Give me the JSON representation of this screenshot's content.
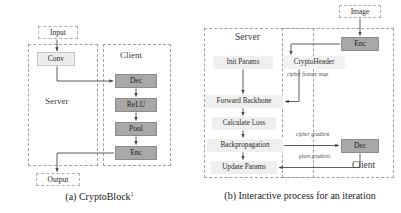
{
  "figure": {
    "subfigures": [
      {
        "id": "a",
        "caption_prefix": "(a)",
        "caption_text": "CryptoBlock",
        "caption_superscript": "1",
        "regions": [
          {
            "name": "server",
            "label": "Server"
          },
          {
            "name": "client",
            "label": "Client"
          }
        ],
        "io_boxes": [
          {
            "name": "input",
            "label": "Input"
          },
          {
            "name": "output",
            "label": "Output"
          }
        ],
        "nodes": [
          {
            "name": "conv",
            "label": "Conv",
            "style": "light"
          },
          {
            "name": "dec",
            "label": "Dec",
            "style": "dark"
          },
          {
            "name": "relu",
            "label": "ReLU",
            "style": "dark"
          },
          {
            "name": "pool",
            "label": "Pool",
            "style": "dark"
          },
          {
            "name": "enc",
            "label": "Enc",
            "style": "dark"
          }
        ]
      },
      {
        "id": "b",
        "caption_prefix": "(b)",
        "caption_text": "Interactive process for an iteration",
        "caption_superscript": "",
        "regions": [
          {
            "name": "server",
            "label": "Server"
          },
          {
            "name": "client",
            "label": "Client"
          }
        ],
        "io_boxes": [
          {
            "name": "image",
            "label": "Image"
          }
        ],
        "nodes": [
          {
            "name": "init-params",
            "label": "Init Params",
            "style": "plain"
          },
          {
            "name": "cryptoheader",
            "label": "CryptoHeader",
            "style": "plain"
          },
          {
            "name": "forward-backbone",
            "label": "Forward Backbone",
            "style": "plain"
          },
          {
            "name": "calculate-loss",
            "label": "Calculate Loss",
            "style": "plain"
          },
          {
            "name": "backpropagation",
            "label": "Backpropagation",
            "style": "plain"
          },
          {
            "name": "update-params",
            "label": "Update Params",
            "style": "plain"
          },
          {
            "name": "enc",
            "label": "Enc",
            "style": "dark"
          },
          {
            "name": "dec",
            "label": "Dec",
            "style": "dark"
          }
        ],
        "edge_labels": [
          {
            "name": "cipher-feature-map",
            "text": "cipher feature map"
          },
          {
            "name": "cipher-gradient",
            "text": "cipher gradient"
          },
          {
            "name": "plain-gradient",
            "text": "plain gradient"
          }
        ]
      }
    ]
  }
}
